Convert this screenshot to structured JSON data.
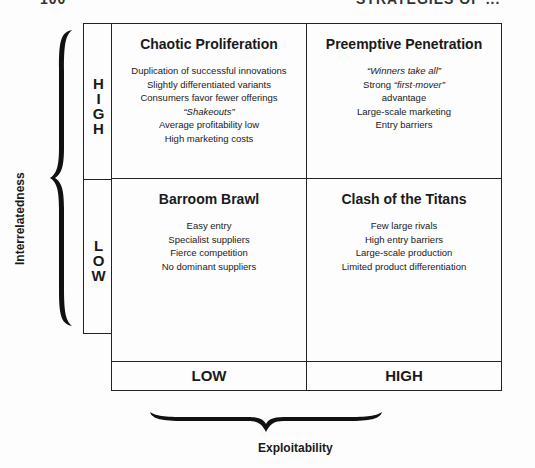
{
  "header": {
    "page_number": "100",
    "running_title": "STRATEGIES OF ..."
  },
  "diagram": {
    "y_axis": {
      "title": "Interrelatedness",
      "high_label": "H\nI\nG\nH",
      "low_label": "L\nO\nW"
    },
    "x_axis": {
      "title": "Exploitability",
      "low_label": "LOW",
      "high_label": "HIGH"
    },
    "quadrants": {
      "top_left": {
        "title": "Chaotic Proliferation",
        "items": [
          "Duplication of successful innovations",
          "Slightly differentiated variants",
          "Consumers favor fewer offerings",
          "“Shakeouts”",
          "Average profitability low",
          "High marketing costs"
        ]
      },
      "top_right": {
        "title": "Preemptive Penetration",
        "items": [
          "“Winners take all”",
          "Strong",
          "“first-mover”",
          "advantage",
          "Large-scale marketing",
          "Entry barriers"
        ]
      },
      "bottom_left": {
        "title": "Barroom Brawl",
        "items": [
          "Easy entry",
          "Specialist suppliers",
          "Fierce competition",
          "No dominant suppliers"
        ]
      },
      "bottom_right": {
        "title": "Clash of the Titans",
        "items": [
          "Few large rivals",
          "High entry barriers",
          "Large-scale production",
          "Limited product differentiation"
        ]
      }
    }
  }
}
